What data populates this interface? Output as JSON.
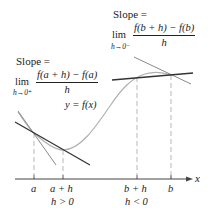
{
  "diagram": {
    "type": "one-sided derivative illustration",
    "curve_label": "y = f(x)",
    "left_annotation": {
      "title": "Slope =",
      "lim": "lim",
      "sub": "h→0⁺",
      "numerator": "f(a + h) − f(a)",
      "denominator": "h"
    },
    "right_annotation": {
      "title": "Slope =",
      "lim": "lim",
      "sub": "h→0⁻",
      "numerator": "f(b + h) − f(b)",
      "denominator": "h"
    },
    "axis": {
      "label": "x",
      "ticks": [
        {
          "label": "a",
          "sublabel": ""
        },
        {
          "label": "a + h",
          "sublabel": "h > 0"
        },
        {
          "label": "b + h",
          "sublabel": "h < 0"
        },
        {
          "label": "b",
          "sublabel": ""
        }
      ]
    },
    "colors": {
      "curve": "#b0b0b0",
      "secant": "#333333",
      "tangent": "#8a8a8a",
      "axis": "#444444",
      "guide": "#b8b8b8"
    }
  }
}
